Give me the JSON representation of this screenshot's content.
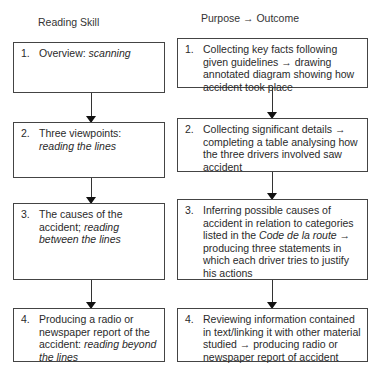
{
  "headings": {
    "left": "Reading Skill",
    "right": "Purpose → Outcome"
  },
  "left_column": [
    {
      "number": "1.",
      "text": "Overview: ",
      "italic": "scanning",
      "after": ""
    },
    {
      "number": "2.",
      "text": "Three viewpoints: ",
      "italic": "reading the lines",
      "after": ""
    },
    {
      "number": "3.",
      "text": "The causes of the accident; ",
      "italic": "reading between the lines",
      "after": ""
    },
    {
      "number": "4.",
      "text": "Producing a radio or newspaper report of the accident: ",
      "italic": "reading beyond the lines",
      "after": ""
    }
  ],
  "right_column": [
    {
      "number": "1.",
      "text": "Collecting key facts following given guidelines → drawing annotated diagram showing how accident took place",
      "italic": "",
      "after": ""
    },
    {
      "number": "2.",
      "text": "Collecting significant details → completing a table analysing how the three drivers involved saw accident",
      "italic": "",
      "after": ""
    },
    {
      "number": "3.",
      "text": "Inferring possible causes of accident in relation to categories listed in the ",
      "italic": "Code de la route",
      "after": " → producing three statements in which each driver tries to justify his actions"
    },
    {
      "number": "4.",
      "text": "Reviewing information contained in text/linking it with other material studied → producing radio or newspaper report of accident",
      "italic": "",
      "after": ""
    }
  ]
}
